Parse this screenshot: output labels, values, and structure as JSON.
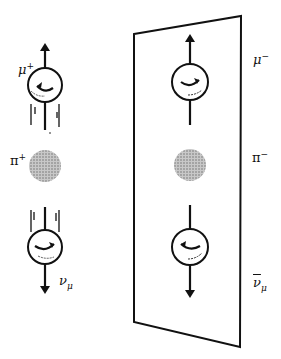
{
  "diagram": {
    "title": "",
    "left": {
      "top_particle": {
        "symbol": "μ",
        "charge": "+",
        "spin_arrow": "up"
      },
      "center_particle": {
        "symbol": "π",
        "charge": "+"
      },
      "bottom_particle": {
        "symbol": "ν",
        "subscript": "μ",
        "spin_arrow": "down"
      }
    },
    "right": {
      "top_particle": {
        "symbol": "μ",
        "charge": "−"
      },
      "center_particle": {
        "symbol": "π",
        "charge": "−"
      },
      "bottom_particle": {
        "symbol": "ν",
        "subscript": "μ",
        "bar": true
      }
    },
    "colors": {
      "ink": "#111111",
      "pion_fill": "#9a9a9a",
      "background": "#ffffff"
    }
  }
}
